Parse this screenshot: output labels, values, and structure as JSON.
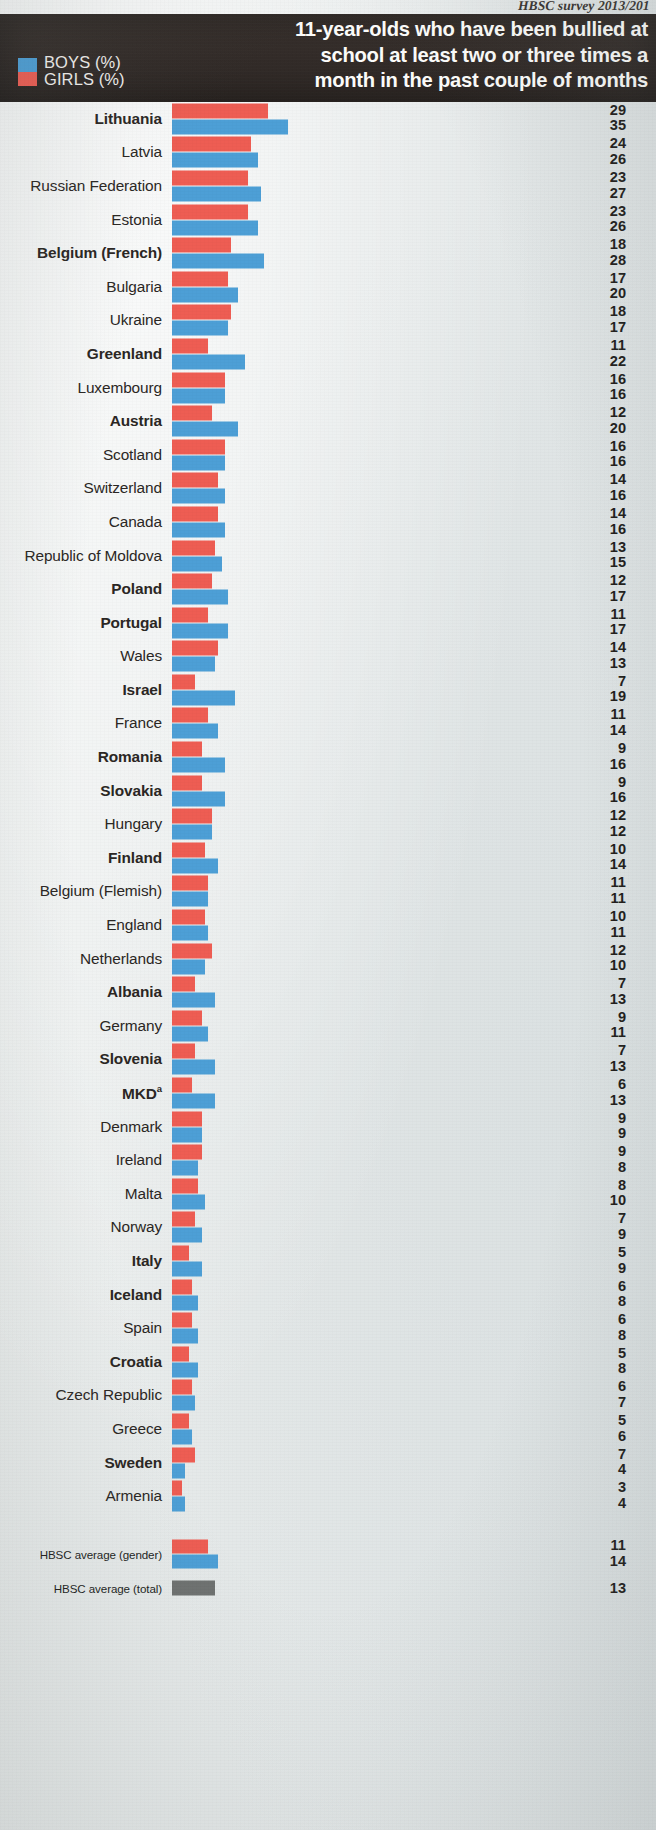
{
  "source_note": "HBSC survey 2013/201",
  "header": {
    "title": "11-year-olds who have been bullied at\nschool at least two or three times a\nmonth in the past couple of months",
    "legend": [
      {
        "label": "BOYS (%)",
        "color": "#4d9fd6",
        "key": "boys"
      },
      {
        "label": "GIRLS (%)",
        "color": "#ee5d53",
        "key": "girls"
      }
    ]
  },
  "chart_data": {
    "type": "bar",
    "orientation": "horizontal",
    "title": "11-year-olds who have been bullied at school at least two or three times a month in the past couple of months",
    "xlabel": "%",
    "ylabel": "",
    "xlim": [
      0,
      35
    ],
    "grid": false,
    "legend_position": "top-left",
    "series": [
      {
        "name": "GIRLS (%)",
        "color": "#ee5d53"
      },
      {
        "name": "BOYS (%)",
        "color": "#4d9fd6"
      }
    ],
    "categories": [
      "Lithuania",
      "Latvia",
      "Russian Federation",
      "Estonia",
      "Belgium (French)",
      "Bulgaria",
      "Ukraine",
      "Greenland",
      "Luxembourg",
      "Austria",
      "Scotland",
      "Switzerland",
      "Canada",
      "Republic of Moldova",
      "Poland",
      "Portugal",
      "Wales",
      "Israel",
      "France",
      "Romania",
      "Slovakia",
      "Hungary",
      "Finland",
      "Belgium (Flemish)",
      "England",
      "Netherlands",
      "Albania",
      "Germany",
      "Slovenia",
      "MKD",
      "Denmark",
      "Ireland",
      "Malta",
      "Norway",
      "Italy",
      "Iceland",
      "Spain",
      "Croatia",
      "Czech Republic",
      "Greece",
      "Sweden",
      "Armenia"
    ],
    "girls": [
      29,
      24,
      23,
      23,
      18,
      17,
      18,
      11,
      16,
      12,
      16,
      14,
      14,
      13,
      12,
      11,
      14,
      7,
      11,
      9,
      9,
      12,
      10,
      11,
      10,
      12,
      7,
      9,
      7,
      6,
      9,
      9,
      8,
      7,
      5,
      6,
      6,
      5,
      6,
      5,
      7,
      3
    ],
    "boys": [
      35,
      26,
      27,
      26,
      28,
      20,
      17,
      22,
      16,
      20,
      16,
      16,
      16,
      15,
      17,
      17,
      13,
      19,
      14,
      16,
      16,
      12,
      14,
      11,
      11,
      10,
      13,
      11,
      13,
      13,
      9,
      8,
      10,
      9,
      9,
      8,
      8,
      8,
      7,
      6,
      4,
      4
    ],
    "averages": [
      {
        "label": "HBSC average (gender)",
        "girls": 11,
        "boys": 14
      },
      {
        "label": "HBSC average (total)",
        "total": 13
      }
    ]
  },
  "rows": [
    {
      "label": "Lithuania",
      "girls": 29,
      "boys": 35,
      "bold": true
    },
    {
      "label": "Latvia",
      "girls": 24,
      "boys": 26,
      "bold": false
    },
    {
      "label": "Russian Federation",
      "girls": 23,
      "boys": 27,
      "bold": false
    },
    {
      "label": "Estonia",
      "girls": 23,
      "boys": 26,
      "bold": false
    },
    {
      "label": "Belgium (French)",
      "girls": 18,
      "boys": 28,
      "bold": true
    },
    {
      "label": "Bulgaria",
      "girls": 17,
      "boys": 20,
      "bold": false
    },
    {
      "label": "Ukraine",
      "girls": 18,
      "boys": 17,
      "bold": false
    },
    {
      "label": "Greenland",
      "girls": 11,
      "boys": 22,
      "bold": true
    },
    {
      "label": "Luxembourg",
      "girls": 16,
      "boys": 16,
      "bold": false
    },
    {
      "label": "Austria",
      "girls": 12,
      "boys": 20,
      "bold": true
    },
    {
      "label": "Scotland",
      "girls": 16,
      "boys": 16,
      "bold": false
    },
    {
      "label": "Switzerland",
      "girls": 14,
      "boys": 16,
      "bold": false
    },
    {
      "label": "Canada",
      "girls": 14,
      "boys": 16,
      "bold": false
    },
    {
      "label": "Republic of Moldova",
      "girls": 13,
      "boys": 15,
      "bold": false
    },
    {
      "label": "Poland",
      "girls": 12,
      "boys": 17,
      "bold": true
    },
    {
      "label": "Portugal",
      "girls": 11,
      "boys": 17,
      "bold": true
    },
    {
      "label": "Wales",
      "girls": 14,
      "boys": 13,
      "bold": false
    },
    {
      "label": "Israel",
      "girls": 7,
      "boys": 19,
      "bold": true
    },
    {
      "label": "France",
      "girls": 11,
      "boys": 14,
      "bold": false
    },
    {
      "label": "Romania",
      "girls": 9,
      "boys": 16,
      "bold": true
    },
    {
      "label": "Slovakia",
      "girls": 9,
      "boys": 16,
      "bold": true
    },
    {
      "label": "Hungary",
      "girls": 12,
      "boys": 12,
      "bold": false
    },
    {
      "label": "Finland",
      "girls": 10,
      "boys": 14,
      "bold": true
    },
    {
      "label": "Belgium (Flemish)",
      "girls": 11,
      "boys": 11,
      "bold": false
    },
    {
      "label": "England",
      "girls": 10,
      "boys": 11,
      "bold": false
    },
    {
      "label": "Netherlands",
      "girls": 12,
      "boys": 10,
      "bold": false
    },
    {
      "label": "Albania",
      "girls": 7,
      "boys": 13,
      "bold": true
    },
    {
      "label": "Germany",
      "girls": 9,
      "boys": 11,
      "bold": false
    },
    {
      "label": "Slovenia",
      "girls": 7,
      "boys": 13,
      "bold": true
    },
    {
      "label": "MKD",
      "footnote": "a",
      "girls": 6,
      "boys": 13,
      "bold": true
    },
    {
      "label": "Denmark",
      "girls": 9,
      "boys": 9,
      "bold": false
    },
    {
      "label": "Ireland",
      "girls": 9,
      "boys": 8,
      "bold": false
    },
    {
      "label": "Malta",
      "girls": 8,
      "boys": 10,
      "bold": false
    },
    {
      "label": "Norway",
      "girls": 7,
      "boys": 9,
      "bold": false
    },
    {
      "label": "Italy",
      "girls": 5,
      "boys": 9,
      "bold": true
    },
    {
      "label": "Iceland",
      "girls": 6,
      "boys": 8,
      "bold": true
    },
    {
      "label": "Spain",
      "girls": 6,
      "boys": 8,
      "bold": false
    },
    {
      "label": "Croatia",
      "girls": 5,
      "boys": 8,
      "bold": true
    },
    {
      "label": "Czech Republic",
      "girls": 6,
      "boys": 7,
      "bold": false
    },
    {
      "label": "Greece",
      "girls": 5,
      "boys": 6,
      "bold": false
    },
    {
      "label": "Sweden",
      "girls": 7,
      "boys": 4,
      "bold": true
    },
    {
      "label": "Armenia",
      "girls": 3,
      "boys": 4,
      "bold": false
    }
  ],
  "average_rows": [
    {
      "label": "HBSC average (gender)",
      "girls": 11,
      "boys": 14
    },
    {
      "label": "HBSC average (total)",
      "total": 13
    }
  ],
  "scale": {
    "px_per_unit": 3.3,
    "bar_origin_x": 172
  }
}
